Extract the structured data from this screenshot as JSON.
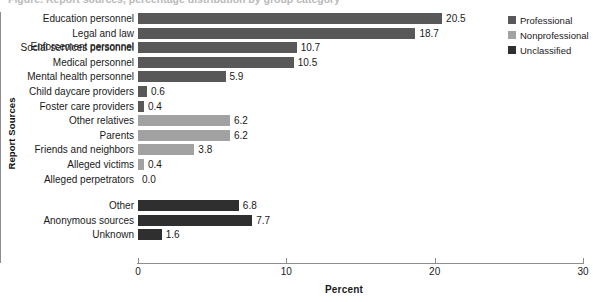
{
  "figure": {
    "title": "Figure. Report sources, percentage distribution by group category",
    "x_axis_title": "Percent",
    "y_axis_title": "Report Sources"
  },
  "colors": {
    "professional": "#585858",
    "nonprofessional": "#a2a2a2",
    "unclassified": "#2f2f2f",
    "axis": "#8d8d8d",
    "text": "#1a1a1a"
  },
  "legend": {
    "items": [
      {
        "label": "Professional",
        "color": "#585858"
      },
      {
        "label": "Nonprofessional",
        "color": "#a2a2a2"
      },
      {
        "label": "Unclassified",
        "color": "#2f2f2f"
      }
    ]
  },
  "chart_data": {
    "type": "bar",
    "orientation": "horizontal",
    "title": "Figure. Report sources, percentage distribution by group category",
    "xlabel": "Percent",
    "ylabel": "Report Sources",
    "xlim": [
      0,
      30
    ],
    "xticks": [
      0,
      10,
      20,
      30
    ],
    "xtick_labels": [
      "0",
      "10",
      "20",
      "30"
    ],
    "grid": false,
    "legend_position": "right",
    "series": [
      {
        "name": "Professional",
        "color": "#585858"
      },
      {
        "name": "Nonprofessional",
        "color": "#a2a2a2"
      },
      {
        "name": "Unclassified",
        "color": "#2f2f2f"
      }
    ],
    "categories": [
      "Education personnel",
      "Legal and law Enforcement personnel",
      "Social services personnel",
      "Medical personnel",
      "Mental health personnel",
      "Child daycare providers",
      "Foster care providers",
      "Other relatives",
      "Parents",
      "Friends and neighbors",
      "Alleged victims",
      "Alleged perpetrators",
      "Other",
      "Anonymous sources",
      "Unknown"
    ],
    "values": [
      20.5,
      18.7,
      10.7,
      10.5,
      5.9,
      0.6,
      0.4,
      6.2,
      6.2,
      3.8,
      0.4,
      0.0,
      6.8,
      7.7,
      1.6
    ],
    "bars": [
      {
        "label": "Education personnel",
        "label_line2": "",
        "value": 20.5,
        "display": "20.5",
        "group": "Professional"
      },
      {
        "label": "Legal and law",
        "label_line2": "Enforcement personnel",
        "value": 18.7,
        "display": "18.7",
        "group": "Professional"
      },
      {
        "label": "Social services personnel",
        "label_line2": "",
        "value": 10.7,
        "display": "10.7",
        "group": "Professional"
      },
      {
        "label": "Medical personnel",
        "label_line2": "",
        "value": 10.5,
        "display": "10.5",
        "group": "Professional"
      },
      {
        "label": "Mental health personnel",
        "label_line2": "",
        "value": 5.9,
        "display": "5.9",
        "group": "Professional"
      },
      {
        "label": "Child daycare providers",
        "label_line2": "",
        "value": 0.6,
        "display": "0.6",
        "group": "Professional"
      },
      {
        "label": "Foster care providers",
        "label_line2": "",
        "value": 0.4,
        "display": "0.4",
        "group": "Professional"
      },
      {
        "label": "Other relatives",
        "label_line2": "",
        "value": 6.2,
        "display": "6.2",
        "group": "Nonprofessional"
      },
      {
        "label": "Parents",
        "label_line2": "",
        "value": 6.2,
        "display": "6.2",
        "group": "Nonprofessional"
      },
      {
        "label": "Friends and neighbors",
        "label_line2": "",
        "value": 3.8,
        "display": "3.8",
        "group": "Nonprofessional"
      },
      {
        "label": "Alleged victims",
        "label_line2": "",
        "value": 0.4,
        "display": "0.4",
        "group": "Nonprofessional"
      },
      {
        "label": "Alleged perpetrators",
        "label_line2": "",
        "value": 0.0,
        "display": "0.0",
        "group": "Nonprofessional"
      },
      {
        "label": "Other",
        "label_line2": "",
        "value": 6.8,
        "display": "6.8",
        "group": "Unclassified"
      },
      {
        "label": "Anonymous sources",
        "label_line2": "",
        "value": 7.7,
        "display": "7.7",
        "group": "Unclassified"
      },
      {
        "label": "Unknown",
        "label_line2": "",
        "value": 1.6,
        "display": "1.6",
        "group": "Unclassified"
      }
    ]
  }
}
